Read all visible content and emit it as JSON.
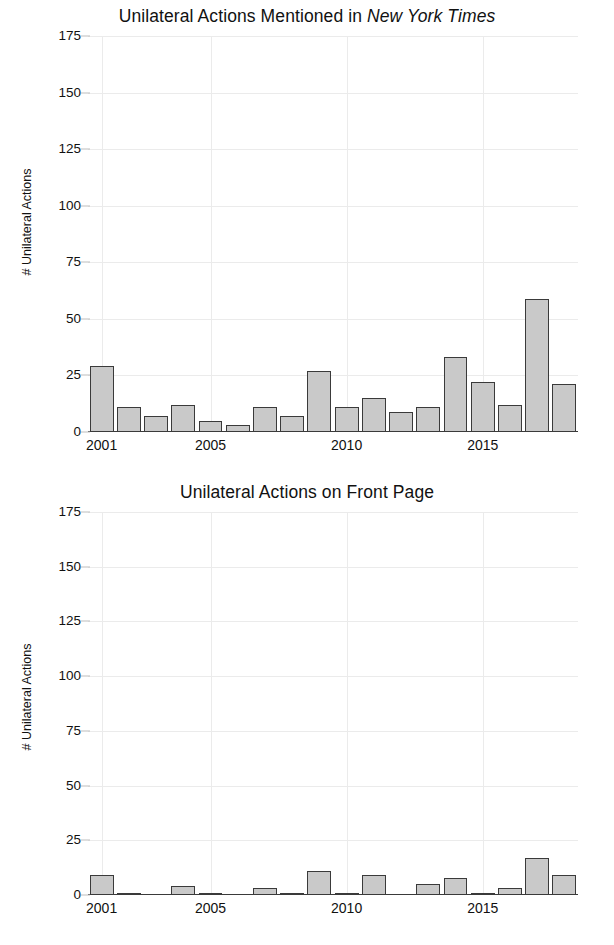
{
  "chart_data": [
    {
      "type": "bar",
      "title": "Unilateral Actions Mentioned in New York Times",
      "title_plain": "Unilateral Actions Mentioned in ",
      "title_italic": "New York Times",
      "xlabel": "",
      "ylabel": "# Unilateral Actions",
      "ylim": [
        0,
        175
      ],
      "yticks": [
        0,
        25,
        50,
        75,
        100,
        125,
        150,
        175
      ],
      "xticks": [
        2001,
        2005,
        2010,
        2015
      ],
      "grid": true,
      "legend": "none",
      "bar_fill": "#c9c9c9",
      "bar_edge": "#3a3a3a",
      "categories": [
        2001,
        2002,
        2003,
        2004,
        2005,
        2006,
        2007,
        2008,
        2009,
        2010,
        2011,
        2012,
        2013,
        2014,
        2015,
        2016,
        2017,
        2018
      ],
      "values": [
        29,
        11,
        7,
        12,
        5,
        3,
        11,
        7,
        27,
        11,
        15,
        9,
        11,
        33,
        22,
        12,
        59,
        21
      ]
    },
    {
      "type": "bar",
      "title": "Unilateral Actions on Front Page",
      "title_plain": "Unilateral Actions on Front Page",
      "title_italic": "",
      "xlabel": "",
      "ylabel": "# Unilateral Actions",
      "ylim": [
        0,
        175
      ],
      "yticks": [
        0,
        25,
        50,
        75,
        100,
        125,
        150,
        175
      ],
      "xticks": [
        2001,
        2005,
        2010,
        2015
      ],
      "grid": true,
      "legend": "none",
      "bar_fill": "#c9c9c9",
      "bar_edge": "#3a3a3a",
      "categories": [
        2001,
        2002,
        2003,
        2004,
        2005,
        2006,
        2007,
        2008,
        2009,
        2010,
        2011,
        2012,
        2013,
        2014,
        2015,
        2016,
        2017,
        2018
      ],
      "values": [
        9,
        1,
        0,
        4,
        0.5,
        0,
        3,
        0.5,
        11,
        1,
        9,
        0,
        5,
        8,
        1,
        3,
        17,
        9
      ]
    }
  ]
}
